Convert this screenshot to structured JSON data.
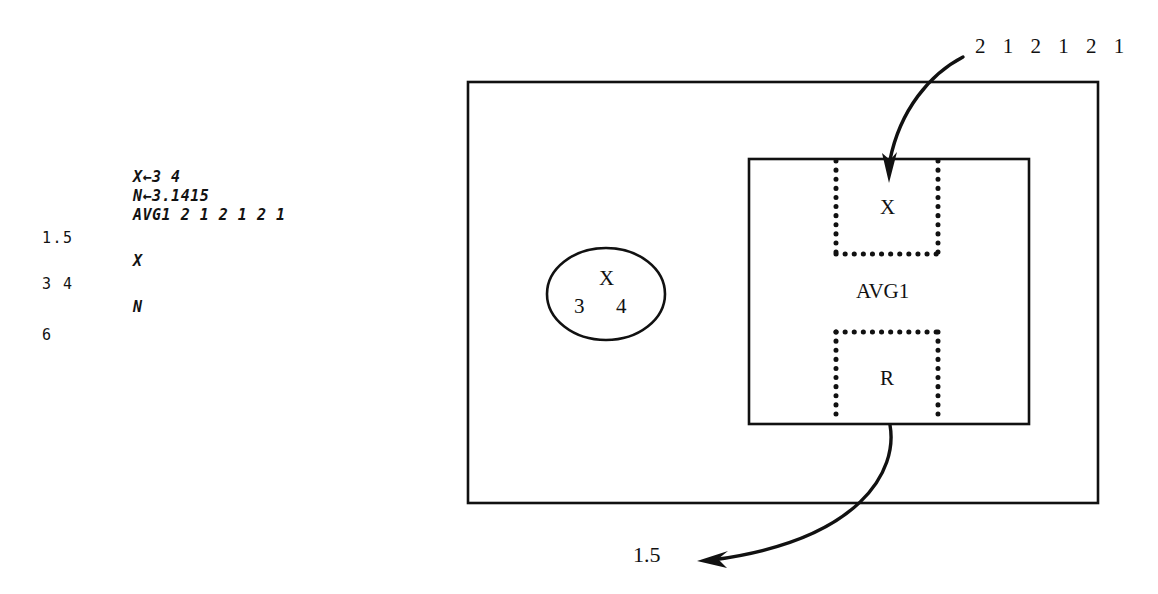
{
  "transcript": {
    "lines": [
      {
        "id": "cmd-assign-x",
        "kind": "code",
        "text": "X←3 4",
        "x": 133,
        "y": 170
      },
      {
        "id": "cmd-assign-n",
        "kind": "code",
        "text": "N←3.1415",
        "x": 133,
        "y": 189
      },
      {
        "id": "cmd-avg1",
        "kind": "code",
        "text": "AVG1 2 1 2 1 2 1",
        "x": 133,
        "y": 208
      },
      {
        "id": "out-avg1",
        "kind": "result",
        "text": "1.5",
        "x": 42,
        "y": 231
      },
      {
        "id": "cmd-show-x",
        "kind": "code",
        "text": "X",
        "x": 133,
        "y": 254
      },
      {
        "id": "out-x",
        "kind": "result",
        "text": "3 4",
        "x": 42,
        "y": 277
      },
      {
        "id": "cmd-show-n",
        "kind": "code",
        "text": "N",
        "x": 133,
        "y": 300
      },
      {
        "id": "out-n",
        "kind": "result",
        "text": "6",
        "x": 42,
        "y": 328
      }
    ]
  },
  "diagram": {
    "input_label": {
      "text": "2 1 2 1 2 1",
      "x": 975,
      "y": 36
    },
    "output_label": {
      "text": "1.5",
      "x": 633,
      "y": 544
    },
    "global_env": {
      "name": "global-environment-box",
      "x": 468,
      "y": 82,
      "w": 630,
      "h": 421
    },
    "variable_bubble": {
      "name_text": "X",
      "value_text": "3      4",
      "cx": 606,
      "cy": 294,
      "rx": 59,
      "ry": 46
    },
    "function_box": {
      "label": "AVG1",
      "x": 749,
      "y": 159,
      "w": 280,
      "h": 265,
      "label_x": 885,
      "label_y": 281
    },
    "local_x": {
      "label": "X",
      "x": 836,
      "y": 159,
      "w": 102,
      "h": 95,
      "label_x": 887,
      "label_y": 198,
      "open_side": "top"
    },
    "local_r": {
      "label": "R",
      "x": 836,
      "y": 331,
      "w": 102,
      "h": 93,
      "label_x": 887,
      "label_y": 369,
      "open_side": "bottom"
    },
    "colors": {
      "stroke": "#111111",
      "background": "#ffffff",
      "text": "#111111"
    }
  }
}
